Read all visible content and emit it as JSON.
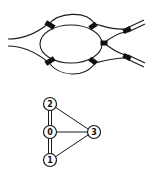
{
  "ribbon_diagram": {
    "description": "Ribbon/fat graph with inner and outer loops joined by black junction blocks",
    "stroke_color": "#1a1a1a",
    "block_color": "#111111"
  },
  "graph": {
    "nodes": [
      {
        "id": "0",
        "label": "0",
        "x": 50,
        "y": 132
      },
      {
        "id": "1",
        "label": "1",
        "x": 50,
        "y": 160
      },
      {
        "id": "2",
        "label": "2",
        "x": 50,
        "y": 104
      },
      {
        "id": "3",
        "label": "3",
        "x": 94,
        "y": 132
      }
    ],
    "edges": [
      {
        "from": "0",
        "to": "2",
        "type": "double"
      },
      {
        "from": "0",
        "to": "1",
        "type": "double"
      },
      {
        "from": "0",
        "to": "3",
        "type": "single"
      },
      {
        "from": "2",
        "to": "3",
        "type": "single"
      },
      {
        "from": "1",
        "to": "3",
        "type": "single"
      }
    ]
  }
}
